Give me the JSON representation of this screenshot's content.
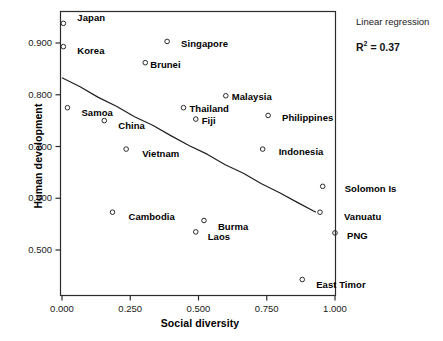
{
  "chart_data": {
    "type": "scatter",
    "title": "",
    "xlabel": "Social diversity",
    "ylabel": "Human development",
    "xlim": [
      -0.06,
      1.06
    ],
    "ylim": [
      0.425,
      0.955
    ],
    "xticks": [
      "0.000",
      "0.250",
      "0.500",
      "0.750",
      "1.000"
    ],
    "xtick_values": [
      0.0,
      0.25,
      0.5,
      0.75,
      1.0
    ],
    "yticks": [
      "0.500",
      "0.600",
      "0.700",
      "0.800",
      "0.900"
    ],
    "ytick_values": [
      0.5,
      0.6,
      0.7,
      0.8,
      0.9
    ],
    "grid": false,
    "marker": "open-circle",
    "points": [
      {
        "name": "Japan",
        "x": 0.005,
        "y": 0.938,
        "label_dx": 14,
        "label_dy": -5
      },
      {
        "name": "Korea",
        "x": 0.005,
        "y": 0.893,
        "label_dx": 14,
        "label_dy": 4
      },
      {
        "name": "Singapore",
        "x": 0.385,
        "y": 0.903,
        "label_dx": 14,
        "label_dy": 3
      },
      {
        "name": "Brunei",
        "x": 0.305,
        "y": 0.862,
        "label_dx": 5,
        "label_dy": 2
      },
      {
        "name": "Malaysia",
        "x": 0.6,
        "y": 0.798,
        "label_dx": 6,
        "label_dy": 1
      },
      {
        "name": "Thailand",
        "x": 0.445,
        "y": 0.775,
        "label_dx": 6,
        "label_dy": 1
      },
      {
        "name": "Samoa",
        "x": 0.02,
        "y": 0.775,
        "label_dx": 14,
        "label_dy": 5
      },
      {
        "name": "Fiji",
        "x": 0.49,
        "y": 0.753,
        "label_dx": 6,
        "label_dy": 2
      },
      {
        "name": "Philippines",
        "x": 0.755,
        "y": 0.76,
        "label_dx": 14,
        "label_dy": 3
      },
      {
        "name": "China",
        "x": 0.155,
        "y": 0.75,
        "label_dx": 14,
        "label_dy": 5
      },
      {
        "name": "Vietnam",
        "x": 0.235,
        "y": 0.695,
        "label_dx": 16,
        "label_dy": 5
      },
      {
        "name": "Indonesia",
        "x": 0.735,
        "y": 0.695,
        "label_dx": 16,
        "label_dy": 3
      },
      {
        "name": "Solomon Is",
        "x": 0.955,
        "y": 0.623,
        "label_dx": 22,
        "label_dy": 3
      },
      {
        "name": "Vanuatu",
        "x": 0.945,
        "y": 0.573,
        "label_dx": 24,
        "label_dy": 5
      },
      {
        "name": "Cambodia",
        "x": 0.185,
        "y": 0.573,
        "label_dx": 16,
        "label_dy": 5
      },
      {
        "name": "Burma",
        "x": 0.52,
        "y": 0.557,
        "label_dx": 14,
        "label_dy": 6
      },
      {
        "name": "PNG",
        "x": 1.0,
        "y": 0.533,
        "label_dx": 12,
        "label_dy": 3
      },
      {
        "name": "Laos",
        "x": 0.49,
        "y": 0.535,
        "label_dx": 12,
        "label_dy": 5
      },
      {
        "name": "East Timor",
        "x": 0.88,
        "y": 0.443,
        "label_dx": 14,
        "label_dy": 6
      }
    ],
    "regression": {
      "label": "Linear regression",
      "r2_text": "R² = 0.37",
      "r2_symbol": "R",
      "r2_exponent": "2",
      "r2_value": "= 0.37",
      "x_start": 0.0,
      "y_start": 0.833,
      "x_end": 0.93,
      "y_end": 0.573
    }
  },
  "annotation": {
    "line1": "Linear regression",
    "r2_symbol": "R",
    "r2_sup": "2",
    "r2_rest": "= 0.37"
  }
}
